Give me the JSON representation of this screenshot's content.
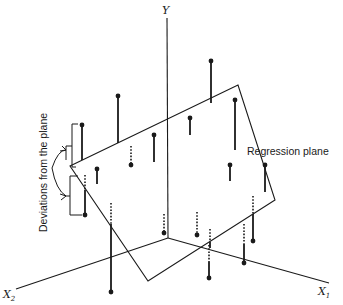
{
  "figure": {
    "axes": {
      "y": {
        "label": "Y"
      },
      "x1": {
        "label": "X",
        "subscript": "1"
      },
      "x2": {
        "label": "X",
        "subscript": "2"
      }
    },
    "annotations": {
      "regression_plane": "Regression plane",
      "deviations": "Deviations from the plane"
    },
    "colors": {
      "ink": "#1a1a1a",
      "background": "#ffffff"
    }
  }
}
